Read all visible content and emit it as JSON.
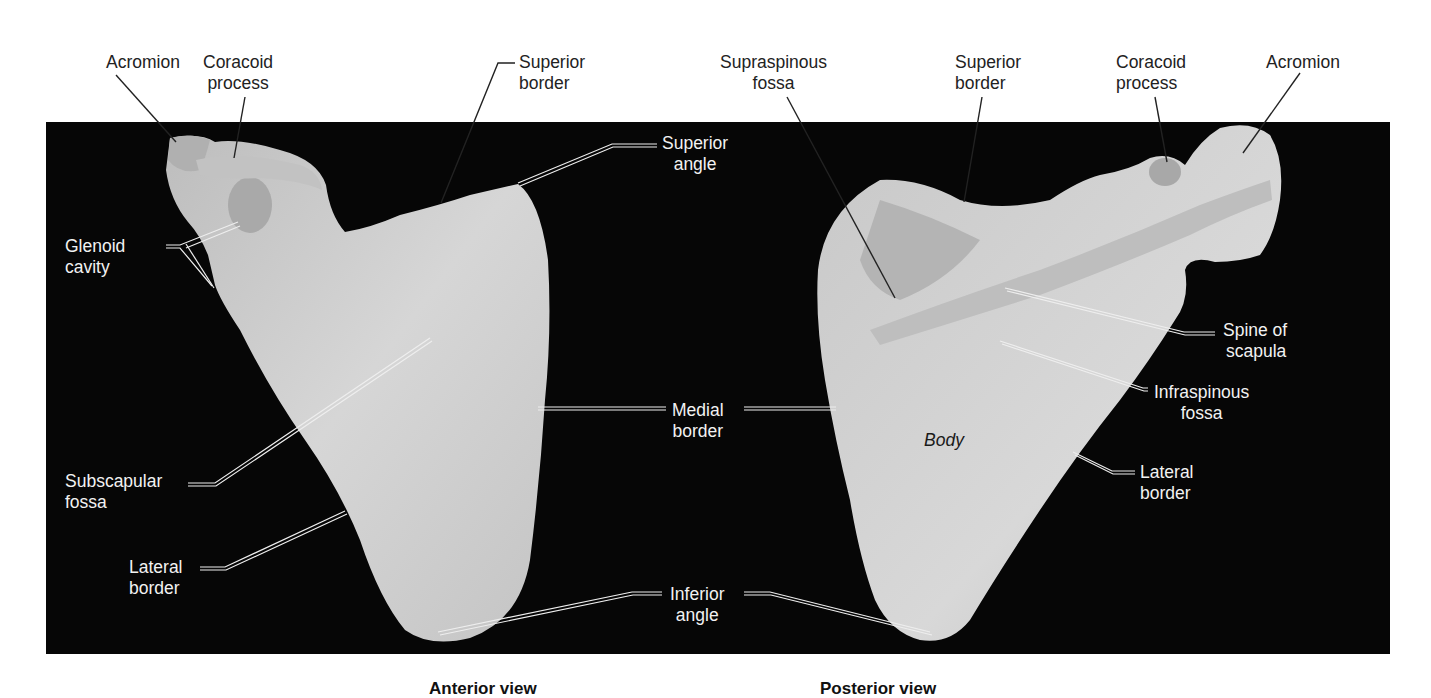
{
  "figure": {
    "subject": "Scapula",
    "colors": {
      "background": "#ffffff",
      "photo_backdrop": "#060606",
      "bone": "#cfcfcf",
      "label_dark": "#222222",
      "label_light": "#f2f2f2"
    },
    "views": [
      {
        "id": "anterior",
        "caption": "Anterior view"
      },
      {
        "id": "posterior",
        "caption": "Posterior view"
      }
    ],
    "labels": {
      "anterior": {
        "acromion": [
          "Acromion"
        ],
        "coracoid_process": [
          "Coracoid",
          "process"
        ],
        "superior_border": [
          "Superior",
          "border"
        ],
        "superior_angle": [
          "Superior",
          "angle"
        ],
        "glenoid_cavity": [
          "Glenoid",
          "cavity"
        ],
        "subscapular_fossa": [
          "Subscapular",
          "fossa"
        ],
        "lateral_border": [
          "Lateral",
          "border"
        ]
      },
      "shared": {
        "medial_border": [
          "Medial",
          "border"
        ],
        "inferior_angle": [
          "Inferior",
          "angle"
        ]
      },
      "posterior": {
        "supraspinous_fossa": [
          "Supraspinous",
          "fossa"
        ],
        "superior_border": [
          "Superior",
          "border"
        ],
        "coracoid_process": [
          "Coracoid",
          "process"
        ],
        "acromion": [
          "Acromion"
        ],
        "spine_of_scapula": [
          "Spine of",
          "scapula"
        ],
        "infraspinous_fossa": [
          "Infraspinous",
          "fossa"
        ],
        "lateral_border": [
          "Lateral",
          "border"
        ],
        "body": [
          "Body"
        ]
      }
    }
  }
}
